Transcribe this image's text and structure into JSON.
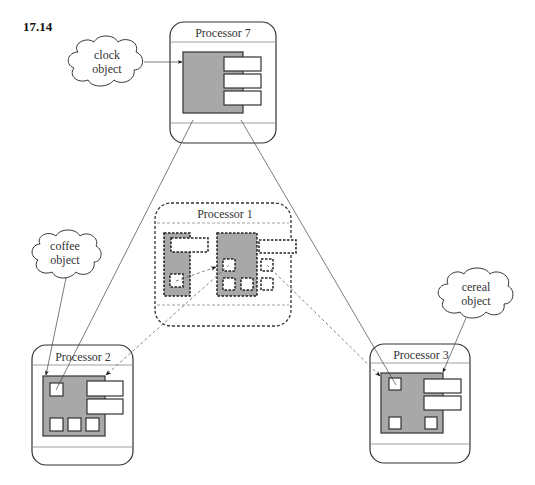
{
  "figure": {
    "number": "17.14"
  },
  "processors": [
    {
      "id": "p7",
      "label": "Processor 7",
      "style": "solid"
    },
    {
      "id": "p1",
      "label": "Processor 1",
      "style": "dashed"
    },
    {
      "id": "p2",
      "label": "Processor 2",
      "style": "solid"
    },
    {
      "id": "p3",
      "label": "Processor 3",
      "style": "solid"
    }
  ],
  "objects": [
    {
      "id": "clock",
      "line1": "clock",
      "line2": "object",
      "target": "Processor 7"
    },
    {
      "id": "coffee",
      "line1": "coffee",
      "line2": "object",
      "target": "Processor 2"
    },
    {
      "id": "cereal",
      "line1": "cereal",
      "line2": "object",
      "target": "Processor 3"
    }
  ],
  "connections": [
    {
      "from": "Processor 7",
      "to": "Processor 2",
      "style": "solid"
    },
    {
      "from": "Processor 7",
      "to": "Processor 3",
      "style": "solid"
    },
    {
      "from": "Processor 1",
      "to": "Processor 2",
      "style": "dashed"
    },
    {
      "from": "Processor 1",
      "to": "Processor 3",
      "style": "dashed"
    }
  ],
  "colors": {
    "object_fill": "#a8a8a8",
    "stroke": "#333333",
    "background": "#ffffff"
  }
}
